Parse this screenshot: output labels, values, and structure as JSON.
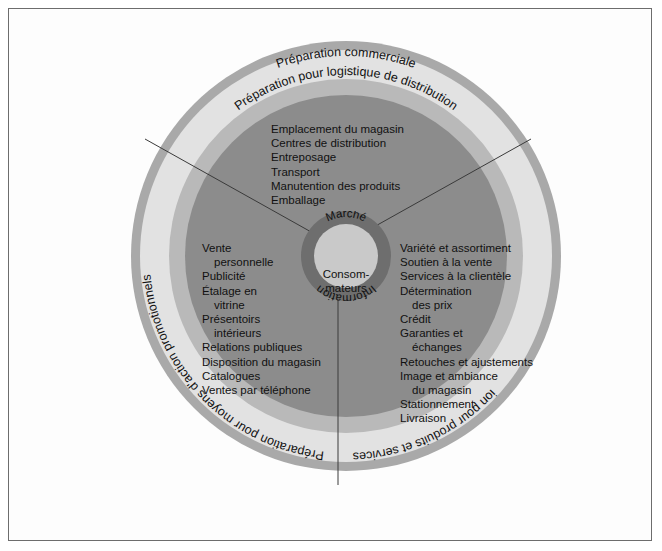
{
  "diagram": {
    "core": {
      "center_label_line1": "Consom-",
      "center_label_line2": "mateurs",
      "top_arc_label": "Marché",
      "bottom_arc_label": "Information"
    },
    "rings": [
      {
        "name": "outer-band",
        "label": "Préparation commerciale",
        "color": "#a9a9a9"
      },
      {
        "name": "light-band",
        "label": "Préparation pour logistique de distribution",
        "color": "#e2e2e2"
      },
      {
        "name": "mid-band",
        "label": "",
        "color": "#b9b9b9"
      },
      {
        "name": "dark-disc",
        "label": "",
        "color": "#8c8c8c"
      }
    ],
    "arc_labels": {
      "top_outer": "Préparation commerciale",
      "top_inner": "Préparation pour logistique de distribution",
      "left": "Préparation pour moyens d'action promotionnels",
      "right": "Préparation pour produits et services"
    },
    "sectors": {
      "logistics": {
        "name": "logistique-de-distribution",
        "items": [
          "Emplacement du magasin",
          "Centres de distribution",
          "Entreposage",
          "Transport",
          "Manutention des produits",
          "Emballage"
        ]
      },
      "promotion": {
        "name": "moyens-d-action-promotionnels",
        "items": [
          "Vente",
          "personnelle",
          "Publicité",
          "Étalage en",
          "vitrine",
          "Présentoirs",
          "intérieurs",
          "Relations publiques",
          "Disposition du magasin",
          "Catalogues",
          "Ventes par téléphone"
        ],
        "indented": [
          false,
          true,
          false,
          false,
          true,
          false,
          true,
          false,
          false,
          false,
          false
        ]
      },
      "products": {
        "name": "produits-et-services",
        "items": [
          "Variété et assortiment",
          "Soutien à la vente",
          "Services à la clientèle",
          "Détermination",
          "des prix",
          "Crédit",
          "Garanties et",
          "échanges",
          "Retouches et ajustements",
          "Image et ambiance",
          "du magasin",
          "Stationnement",
          "Livraison"
        ],
        "indented": [
          false,
          false,
          false,
          false,
          true,
          false,
          false,
          true,
          false,
          false,
          true,
          false,
          false
        ]
      }
    },
    "colors": {
      "background": "#ffffff",
      "frame_border": "#6d6d6d",
      "band_outer": "#a9a9a9",
      "band_light": "#e2e2e2",
      "band_mid": "#b9b9b9",
      "disc_dark": "#8c8c8c",
      "core_ring": "#6e6e6e",
      "core_center": "#c9c9c9",
      "text": "#111111",
      "separator": "#3a3a3a"
    }
  }
}
